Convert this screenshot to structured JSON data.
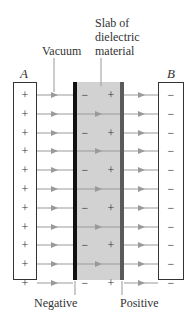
{
  "labels": {
    "slab_line1": "Slab of",
    "slab_line2": "dielectric",
    "slab_line3": "material",
    "vacuum": "Vacuum",
    "plate_a": "A",
    "plate_b": "B",
    "negative": "Negative",
    "positive": "Positive"
  },
  "symbols": {
    "plus": "+",
    "minus": "−"
  },
  "colors": {
    "slab_fill": "#d2d2d2",
    "negative_surface": "#111111",
    "positive_surface": "#5a5a5a",
    "field_line": "#9a9a9a",
    "plate_border": "#333333"
  },
  "rows": [
    {
      "type": "charges"
    },
    {
      "type": "through"
    },
    {
      "type": "charges"
    },
    {
      "type": "through"
    },
    {
      "type": "charges"
    },
    {
      "type": "through"
    },
    {
      "type": "charges"
    },
    {
      "type": "through"
    },
    {
      "type": "charges"
    },
    {
      "type": "through"
    },
    {
      "type": "charges"
    }
  ]
}
